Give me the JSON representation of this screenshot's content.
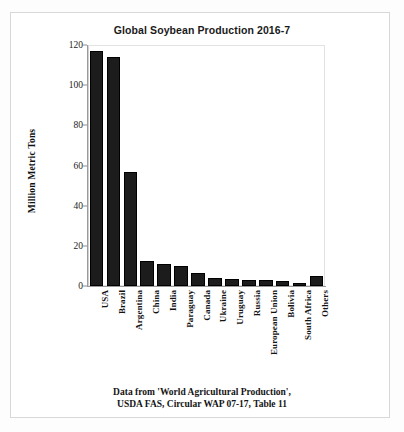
{
  "chart_data": {
    "type": "bar",
    "title": "Global Soybean Production 2016-7",
    "xlabel": "",
    "ylabel": "Million Metric Tons",
    "ylim": [
      0,
      120
    ],
    "yticks": [
      0,
      20,
      40,
      60,
      80,
      100,
      120
    ],
    "grid": false,
    "legend": null,
    "categories": [
      "USA",
      "Brazil",
      "Argentina",
      "China",
      "India",
      "Paraguay",
      "Canada",
      "Ukraine",
      "Uruguay",
      "Russia",
      "European Union",
      "Bolivia",
      "South Africa",
      "Others"
    ],
    "values": [
      117,
      114,
      57,
      12.5,
      11,
      10,
      6.5,
      4,
      3.5,
      3.2,
      2.8,
      2.5,
      1.3,
      5
    ],
    "bar_color": "#1c1c1c"
  },
  "caption": {
    "line1": "Data from 'World Agricultural Production',",
    "line2": "USDA FAS, Circular WAP 07-17, Table 11"
  }
}
